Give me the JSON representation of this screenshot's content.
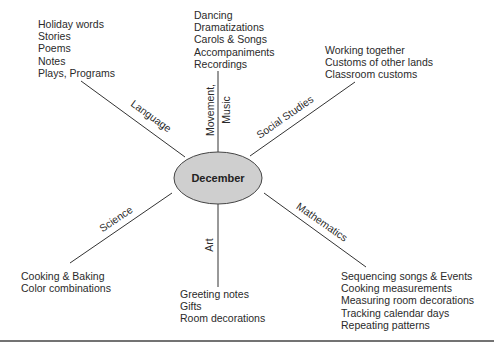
{
  "center": {
    "label": "December",
    "fill": "#cfcfcf"
  },
  "branches": {
    "language": {
      "label": "Language",
      "items": [
        "Holiday words",
        "Stories",
        "Poems",
        "Notes",
        "Plays, Programs"
      ]
    },
    "music": {
      "label_line1": "Movement,",
      "label_line2": "Music",
      "items": [
        "Dancing",
        "Dramatizations",
        "Carols & Songs",
        "Accompaniments",
        "Recordings"
      ]
    },
    "social": {
      "label": "Social Studies",
      "items": [
        "Working together",
        "Customs of other lands",
        "Classroom customs"
      ]
    },
    "science": {
      "label": "Science",
      "items": [
        "Cooking & Baking",
        "Color combinations"
      ]
    },
    "art": {
      "label": "Art",
      "items": [
        "Greeting notes",
        "Gifts",
        "Room decorations"
      ]
    },
    "math": {
      "label": "Mathematics",
      "items": [
        "Sequencing songs & Events",
        "Cooking measurements",
        "Measuring room decorations",
        "Tracking calendar days",
        "Repeating patterns"
      ]
    }
  }
}
